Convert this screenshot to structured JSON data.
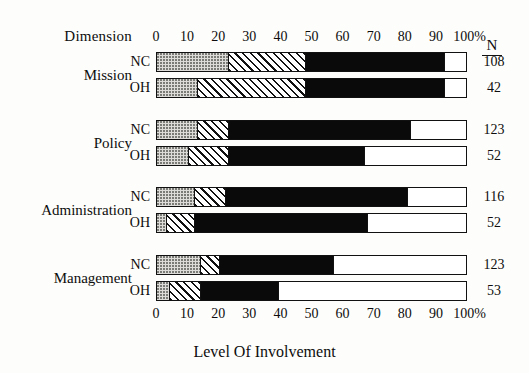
{
  "header": {
    "dimension_label": "Dimension",
    "n_label": "N"
  },
  "axis": {
    "ticks": [
      "0",
      "10",
      "20",
      "30",
      "40",
      "50",
      "60",
      "70",
      "80",
      "90",
      "100%"
    ],
    "min": 0,
    "max": 100
  },
  "xlabel": "Level Of Involvement",
  "groups": [
    {
      "name": "Mission",
      "rows": [
        {
          "label": "NC",
          "n": "108",
          "segments": [
            23,
            25,
            45,
            7
          ]
        },
        {
          "label": "OH",
          "n": "42",
          "segments": [
            13,
            35,
            45,
            7
          ]
        }
      ]
    },
    {
      "name": "Policy",
      "rows": [
        {
          "label": "NC",
          "n": "123",
          "segments": [
            13,
            10,
            59,
            18
          ]
        },
        {
          "label": "OH",
          "n": "52",
          "segments": [
            10,
            13,
            44,
            33
          ]
        }
      ]
    },
    {
      "name": "Administration",
      "rows": [
        {
          "label": "NC",
          "n": "116",
          "segments": [
            12,
            10,
            59,
            19
          ]
        },
        {
          "label": "OH",
          "n": "52",
          "segments": [
            3,
            9,
            56,
            32
          ]
        }
      ]
    },
    {
      "name": "Management",
      "rows": [
        {
          "label": "NC",
          "n": "123",
          "segments": [
            14,
            6,
            37,
            43
          ]
        },
        {
          "label": "OH",
          "n": "53",
          "segments": [
            4,
            10,
            25,
            61
          ]
        }
      ]
    }
  ],
  "chart_data": {
    "type": "bar",
    "title": "",
    "xlabel": "Level Of Involvement",
    "ylabel": "Dimension",
    "orientation": "horizontal",
    "stacked": true,
    "normalized_percent": true,
    "xlim": [
      0,
      100
    ],
    "xticks": [
      0,
      10,
      20,
      30,
      40,
      50,
      60,
      70,
      80,
      90,
      100
    ],
    "xtick_labels": [
      "0",
      "10",
      "20",
      "30",
      "40",
      "50",
      "60",
      "70",
      "80",
      "90",
      "100%"
    ],
    "grid": false,
    "legend": "none",
    "axis_positions": [
      "top",
      "bottom"
    ],
    "categories": [
      "Mission NC",
      "Mission OH",
      "Policy NC",
      "Policy OH",
      "Administration NC",
      "Administration OH",
      "Management NC",
      "Management OH"
    ],
    "group_names": [
      "Mission",
      "Policy",
      "Administration",
      "Management"
    ],
    "sample_sizes": [
      108,
      42,
      123,
      52,
      116,
      52,
      123,
      53
    ],
    "series": [
      {
        "name": "segment-1-dotted",
        "pattern": "dotted",
        "color": "#dddcd8",
        "values": [
          23,
          13,
          13,
          10,
          12,
          3,
          14,
          4
        ]
      },
      {
        "name": "segment-2-hatched",
        "pattern": "diagonal-hatch",
        "color": "#ffffff",
        "values": [
          25,
          35,
          10,
          13,
          10,
          9,
          6,
          10
        ]
      },
      {
        "name": "segment-3-solid",
        "pattern": "solid",
        "color": "#0a0a0a",
        "values": [
          45,
          45,
          59,
          44,
          59,
          56,
          37,
          25
        ]
      },
      {
        "name": "segment-4-empty",
        "pattern": "none",
        "color": "#ffffff",
        "values": [
          7,
          7,
          18,
          33,
          19,
          32,
          43,
          61
        ]
      }
    ]
  }
}
